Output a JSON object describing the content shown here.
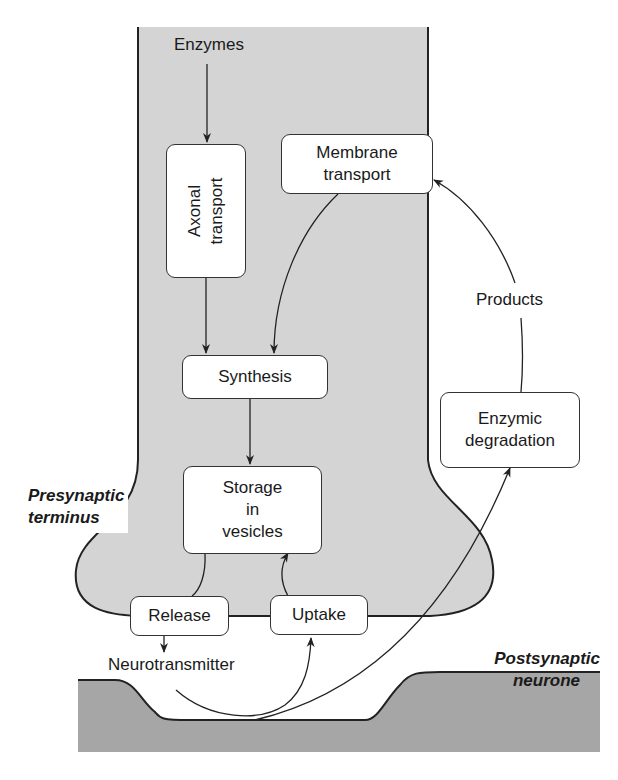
{
  "diagram": {
    "type": "flow",
    "regions": {
      "presynaptic": {
        "label_line1": "Presynaptic",
        "label_line2": "terminus"
      },
      "postsynaptic": {
        "label_line1": "Postsynaptic",
        "label_line2": "neurone"
      }
    },
    "nodes": {
      "enzymes": "Enzymes",
      "axonal_transport_line1": "Axonal",
      "axonal_transport_line2": "transport",
      "membrane_transport_line1": "Membrane",
      "membrane_transport_line2": "transport",
      "synthesis": "Synthesis",
      "storage_line1": "Storage",
      "storage_line2": "in",
      "storage_line3": "vesicles",
      "release": "Release",
      "uptake": "Uptake",
      "neurotransmitter": "Neurotransmitter",
      "enzymic_degradation_line1": "Enzymic",
      "enzymic_degradation_line2": "degradation",
      "products": "Products"
    },
    "edges": [
      [
        "Enzymes",
        "Axonal transport"
      ],
      [
        "Axonal transport",
        "Synthesis"
      ],
      [
        "Membrane transport",
        "Synthesis"
      ],
      [
        "Synthesis",
        "Storage in vesicles"
      ],
      [
        "Storage in vesicles",
        "Release"
      ],
      [
        "Release",
        "Neurotransmitter"
      ],
      [
        "Neurotransmitter",
        "Uptake"
      ],
      [
        "Uptake",
        "Storage in vesicles"
      ],
      [
        "Neurotransmitter",
        "Enzymic degradation"
      ],
      [
        "Enzymic degradation",
        "Products"
      ],
      [
        "Products",
        "Membrane transport"
      ]
    ],
    "colors": {
      "presynaptic_fill": "#d4d4d4",
      "postsynaptic_fill": "#a6a6a6",
      "stroke": "#222222",
      "box_fill": "#ffffff"
    }
  }
}
